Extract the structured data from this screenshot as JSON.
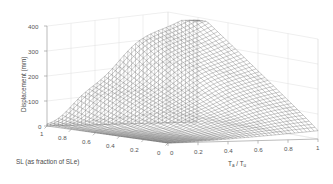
{
  "figure": {
    "background_color": "#ffffff",
    "mesh_color": "#4d4d4d",
    "grid_color": "#d9d9d9",
    "axis_color": "#9a9a9a"
  },
  "chart_data": {
    "type": "surface",
    "title": "",
    "zlabel": "Displacement (mm)",
    "xlabel": "SL (as fraction of SLe)",
    "ylabel_main": "T",
    "ylabel_sub1": "a",
    "ylabel_mid": " / T",
    "ylabel_sub2": "u",
    "ylabel": "T_a / T_u",
    "zlim": [
      0,
      400
    ],
    "zticks": [
      0,
      100,
      200,
      300,
      400
    ],
    "ztick_labels": [
      "0",
      "100",
      "200",
      "300",
      "400"
    ],
    "xlim": [
      0,
      1
    ],
    "xticks": [
      1,
      0.8,
      0.6,
      0.4,
      0.2,
      0
    ],
    "xtick_labels": [
      "1",
      "0.8",
      "0.6",
      "0.4",
      "0.2",
      "0"
    ],
    "ylim": [
      0,
      1
    ],
    "yticks": [
      0,
      0.2,
      0.4,
      0.6,
      0.8,
      1
    ],
    "ytick_labels": [
      "0",
      "0.2",
      "0.4",
      "0.6",
      "0.8",
      "1"
    ],
    "grid": true,
    "legend": "none",
    "mesh_style": "wireframe",
    "nx": 42,
    "ny": 40,
    "surface_description": "Displacement surface rising from near 0 at low SL / low Ta/Tu to roughly 400 mm at SL=1 and Ta/Tu=1, with two sigmoidal wave ridges crossing the domain",
    "z_corner_values": {
      "x0_y0": 0,
      "x1_y0": 10,
      "x0_y1": 30,
      "x1_y1": 400
    },
    "z_samples_x": [
      0,
      0.2,
      0.4,
      0.6,
      0.8,
      1
    ],
    "z_samples_y": [
      0,
      0.2,
      0.4,
      0.6,
      0.8,
      1
    ],
    "z_grid": [
      [
        0,
        2,
        6,
        14,
        24,
        32
      ],
      [
        2,
        10,
        28,
        55,
        80,
        100
      ],
      [
        5,
        25,
        70,
        125,
        170,
        200
      ],
      [
        10,
        48,
        120,
        205,
        265,
        300
      ],
      [
        16,
        70,
        165,
        265,
        340,
        370
      ],
      [
        22,
        88,
        195,
        300,
        380,
        400
      ]
    ]
  }
}
